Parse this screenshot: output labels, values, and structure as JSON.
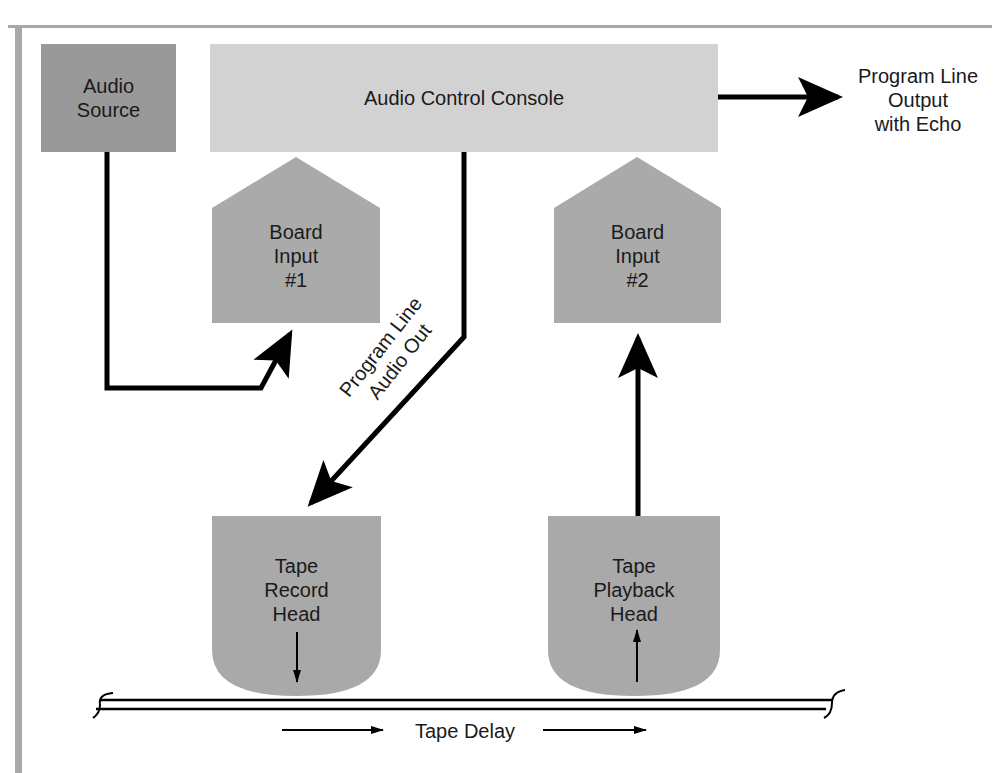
{
  "diagram": {
    "type": "signal-flow",
    "colors": {
      "audio_source_fill": "#999999",
      "console_fill": "#d2d2d2",
      "board_input_fill": "#aaaaaa",
      "tape_head_fill": "#a9a9a9",
      "line": "#000000",
      "frame": "#a8a8a8"
    },
    "nodes": {
      "audio_source": {
        "label_line1": "Audio",
        "label_line2": "Source"
      },
      "console": {
        "label": "Audio Control Console"
      },
      "output": {
        "line1": "Program Line",
        "line2": "Output",
        "line3": "with Echo"
      },
      "board_input_1": {
        "line1": "Board",
        "line2": "Input",
        "line3": "#1"
      },
      "board_input_2": {
        "line1": "Board",
        "line2": "Input",
        "line3": "#2"
      },
      "tape_record_head": {
        "line1": "Tape",
        "line2": "Record",
        "line3": "Head"
      },
      "tape_playback_head": {
        "line1": "Tape",
        "line2": "Playback",
        "line3": "Head"
      }
    },
    "edges": {
      "program_line_audio_out": {
        "line1": "Program Line",
        "line2": "Audio Out"
      }
    },
    "tape": {
      "label": "Tape Delay"
    }
  }
}
